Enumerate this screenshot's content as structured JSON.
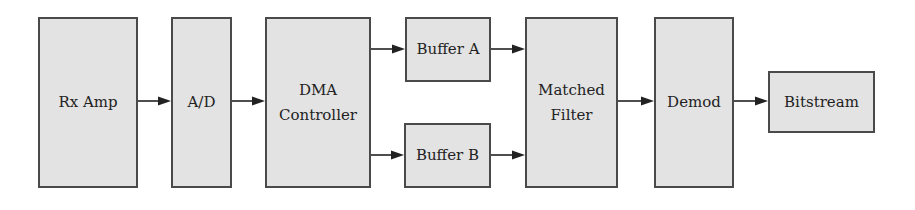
{
  "diagram": {
    "type": "block-diagram",
    "colors": {
      "block_fill": "#e3e3e3",
      "block_border": "#4a4a4a",
      "arrow": "#222222",
      "background": "#ffffff"
    },
    "blocks": [
      {
        "id": "rx_amp",
        "label": "Rx Amp",
        "x": 38,
        "y": 17,
        "w": 100,
        "h": 171
      },
      {
        "id": "ad",
        "label": "A/D",
        "x": 171,
        "y": 17,
        "w": 61,
        "h": 171
      },
      {
        "id": "dma",
        "label": "DMA\nController",
        "x": 265,
        "y": 17,
        "w": 106,
        "h": 171
      },
      {
        "id": "buf_a",
        "label": "Buffer A",
        "x": 405,
        "y": 17,
        "w": 86,
        "h": 65
      },
      {
        "id": "buf_b",
        "label": "Buffer B",
        "x": 404,
        "y": 123,
        "w": 87,
        "h": 65
      },
      {
        "id": "mf",
        "label": "Matched\nFilter",
        "x": 525,
        "y": 17,
        "w": 93,
        "h": 171
      },
      {
        "id": "demod",
        "label": "Demod",
        "x": 654,
        "y": 17,
        "w": 80,
        "h": 171
      },
      {
        "id": "bits",
        "label": "Bitstream",
        "x": 768,
        "y": 71,
        "w": 107,
        "h": 62
      }
    ],
    "edges": [
      {
        "from": "rx_amp",
        "to": "ad",
        "x1": 138,
        "x2": 171,
        "y": 101
      },
      {
        "from": "ad",
        "to": "dma",
        "x1": 232,
        "x2": 265,
        "y": 101
      },
      {
        "from": "dma",
        "to": "buf_a",
        "x1": 371,
        "x2": 405,
        "y": 49
      },
      {
        "from": "dma",
        "to": "buf_b",
        "x1": 371,
        "x2": 404,
        "y": 155
      },
      {
        "from": "buf_a",
        "to": "mf",
        "x1": 491,
        "x2": 525,
        "y": 49
      },
      {
        "from": "buf_b",
        "to": "mf",
        "x1": 491,
        "x2": 525,
        "y": 155
      },
      {
        "from": "mf",
        "to": "demod",
        "x1": 618,
        "x2": 654,
        "y": 101
      },
      {
        "from": "demod",
        "to": "bits",
        "x1": 734,
        "x2": 768,
        "y": 101
      }
    ]
  }
}
